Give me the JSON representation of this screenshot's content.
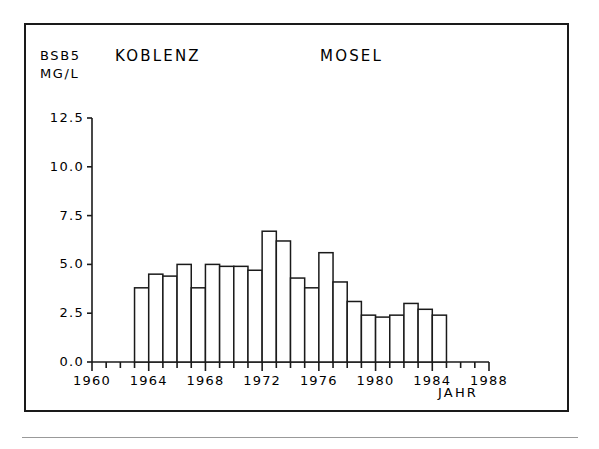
{
  "figure": {
    "border_color": "#1a1a1a",
    "background": "#ffffff"
  },
  "header": {
    "parameter": "BSB5",
    "unit": "MG/L",
    "station": "KOBLENZ",
    "river": "MOSEL",
    "xaxis_caption": "JAHR"
  },
  "chart_data": {
    "type": "bar",
    "title": "KOBLENZ MOSEL",
    "xlabel": "JAHR",
    "ylabel": "BSB5 MG/L",
    "ylim": [
      0.0,
      12.5
    ],
    "xlim": [
      1960,
      1988
    ],
    "grid": false,
    "legend": "none",
    "ytick_labels": [
      "0.0",
      "2.5",
      "5.0",
      "7.5",
      "10.0",
      "12.5"
    ],
    "ytick_values": [
      0.0,
      2.5,
      5.0,
      7.5,
      10.0,
      12.5
    ],
    "xtick_labels": [
      "1960",
      "1964",
      "1968",
      "1972",
      "1976",
      "1980",
      "1984",
      "1988"
    ],
    "xtick_values": [
      1960,
      1964,
      1968,
      1972,
      1976,
      1980,
      1984,
      1988
    ],
    "xtick_minor_step": 1,
    "bar_edge_color": "#1a1a1a",
    "bar_fill_color": "#ffffff",
    "categories": [
      1963,
      1964,
      1965,
      1966,
      1967,
      1968,
      1969,
      1970,
      1971,
      1972,
      1973,
      1974,
      1975,
      1976,
      1977,
      1978,
      1979,
      1980,
      1981,
      1982,
      1983,
      1984
    ],
    "values": [
      3.8,
      4.5,
      4.4,
      5.0,
      3.8,
      5.0,
      4.9,
      4.9,
      4.7,
      6.7,
      6.2,
      4.3,
      3.8,
      5.6,
      4.1,
      3.1,
      2.4,
      2.3,
      2.4,
      3.0,
      2.7,
      2.4
    ]
  }
}
